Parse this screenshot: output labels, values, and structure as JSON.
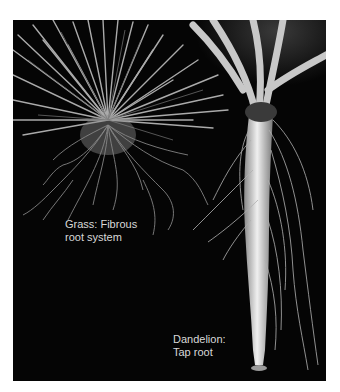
{
  "figure": {
    "background_color": "#050505",
    "labels": {
      "grass": {
        "line1": "Grass: Fibrous",
        "line2": "root system"
      },
      "dandelion": {
        "line1": "Dandelion:",
        "line2": "Tap root"
      }
    }
  }
}
